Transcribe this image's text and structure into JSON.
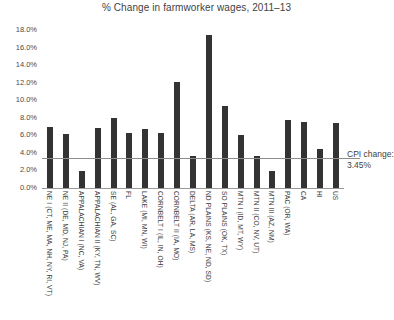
{
  "chart_data": {
    "type": "bar",
    "title": "% Change in farmworker wages, 2011–13",
    "xlabel": "",
    "ylabel": "",
    "ylim": [
      0,
      18
    ],
    "ytick_labels": [
      "18.0%",
      "16.0%",
      "14.0%",
      "12.0%",
      "10.0%",
      "8.0%",
      "6.0%",
      "4.0%",
      "2.0%",
      "0.0%"
    ],
    "ytick_values": [
      18,
      16,
      14,
      12,
      10,
      8,
      6,
      4,
      2,
      0
    ],
    "grid": false,
    "legend": "none",
    "bar_color": "#333333",
    "reference_line": {
      "label": "CPI change:",
      "value_label": "3.45%",
      "value": 3.45,
      "color": "#8d8d8d"
    },
    "categories": [
      "NE I (CT, ME, MA, NH, NY, RI, VT)",
      "NE II (DE, MD, NJ, PA)",
      "APPALACHIAN I (NC, VA)",
      "APPALACHIAN II (KY, TN, WV)",
      "SE (AL, GA, SC)",
      "FL",
      "LAKE (MI, MN, WI)",
      "CORNBELT I (IL, IN, OH)",
      "CORNBELT II (IA, MO)",
      "DELTA (AR, LA, MS)",
      "ND PLAINS (KS, NE, ND, SD)",
      "SO PLAINS (OK, TX)",
      "MTN I (ID, MT, WY)",
      "MTN II (CO, NV, UT)",
      "MTN III (AZ, NM)",
      "PAC (OR, WA)",
      "CA",
      "HI",
      "US"
    ],
    "values": [
      6.9,
      6.1,
      1.9,
      6.8,
      8.0,
      6.3,
      6.7,
      6.3,
      12.1,
      3.6,
      17.4,
      9.3,
      6.0,
      3.7,
      1.9,
      7.8,
      7.5,
      4.5,
      7.4
    ]
  }
}
